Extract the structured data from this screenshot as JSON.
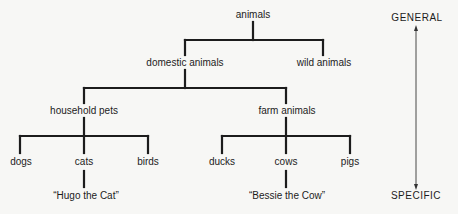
{
  "diagram": {
    "type": "hierarchy-tree",
    "root": "animals",
    "nodes": {
      "animals": "animals",
      "domestic": "domestic animals",
      "wild": "wild animals",
      "household": "household pets",
      "farm": "farm animals",
      "dogs": "dogs",
      "cats": "cats",
      "birds": "birds",
      "ducks": "ducks",
      "cows": "cows",
      "pigs": "pigs",
      "hugo": "“Hugo the Cat”",
      "bessie": "“Bessie the Cow”"
    },
    "edges": [
      [
        "animals",
        "domestic animals"
      ],
      [
        "animals",
        "wild animals"
      ],
      [
        "domestic animals",
        "household pets"
      ],
      [
        "domestic animals",
        "farm animals"
      ],
      [
        "household pets",
        "dogs"
      ],
      [
        "household pets",
        "cats"
      ],
      [
        "household pets",
        "birds"
      ],
      [
        "farm animals",
        "ducks"
      ],
      [
        "farm animals",
        "cows"
      ],
      [
        "farm animals",
        "pigs"
      ],
      [
        "cats",
        "“Hugo the Cat”"
      ],
      [
        "cows",
        "“Bessie the Cow”"
      ]
    ],
    "scale": {
      "top_label": "GENERAL",
      "bottom_label": "SPECIFIC"
    },
    "colors": {
      "background": "#f7f7f5",
      "lines": "#1c1c1c",
      "text": "#1c1c1c"
    }
  }
}
